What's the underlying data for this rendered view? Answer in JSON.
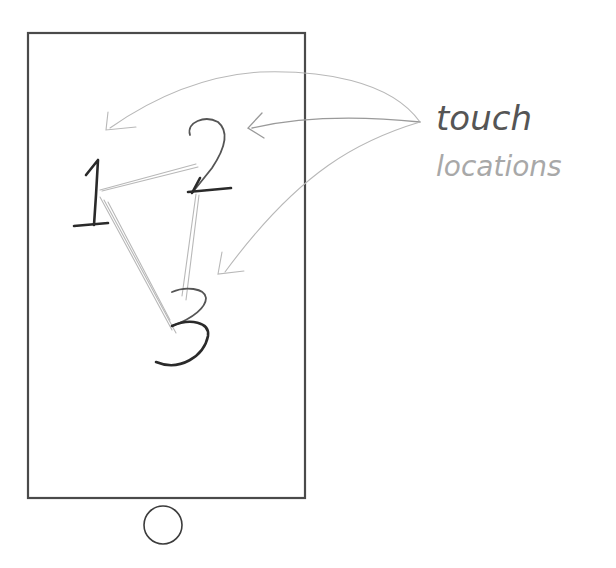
{
  "sketch": {
    "title": "Phone touch locations sketch",
    "device": {
      "screen": {
        "x": 28,
        "y": 33,
        "width": 277,
        "height": 465
      },
      "home_button": {
        "cx": 163,
        "cy": 525,
        "r": 19
      }
    },
    "touch_points": [
      {
        "label": "1",
        "x": 100,
        "y": 192
      },
      {
        "label": "2",
        "x": 210,
        "y": 160
      },
      {
        "label": "3",
        "x": 180,
        "y": 325
      }
    ],
    "connections": [
      [
        "1",
        "2"
      ],
      [
        "2",
        "3"
      ],
      [
        "3",
        "1"
      ]
    ],
    "annotation": {
      "line1": "touch",
      "line2": "locations",
      "color_line1": "#555555",
      "color_line2": "#9a9a9a"
    },
    "arrow_targets": [
      "empty-area-top-left",
      "touch-point-2",
      "touch-point-3"
    ]
  }
}
